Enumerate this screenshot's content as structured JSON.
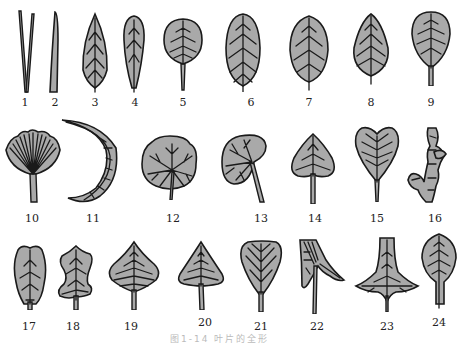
{
  "figure": {
    "caption": "图1-14  叶片的全形",
    "fill_color": "#a9a9a9",
    "stroke_color": "#1a1a1a",
    "leaves": [
      {
        "id": 1,
        "label": "1",
        "shape": "needle-pair"
      },
      {
        "id": 2,
        "label": "2",
        "shape": "linear"
      },
      {
        "id": 3,
        "label": "3",
        "shape": "lanceolate"
      },
      {
        "id": 4,
        "label": "4",
        "shape": "oblanceolate"
      },
      {
        "id": 5,
        "label": "5",
        "shape": "orbicular"
      },
      {
        "id": 6,
        "label": "6",
        "shape": "oblong"
      },
      {
        "id": 7,
        "label": "7",
        "shape": "elliptic"
      },
      {
        "id": 8,
        "label": "8",
        "shape": "ovate"
      },
      {
        "id": 9,
        "label": "9",
        "shape": "obovate"
      },
      {
        "id": 10,
        "label": "10",
        "shape": "flabellate"
      },
      {
        "id": 11,
        "label": "11",
        "shape": "falcate"
      },
      {
        "id": 12,
        "label": "12",
        "shape": "peltate"
      },
      {
        "id": 13,
        "label": "13",
        "shape": "reniform"
      },
      {
        "id": 14,
        "label": "14",
        "shape": "cordate"
      },
      {
        "id": 15,
        "label": "15",
        "shape": "obcordate"
      },
      {
        "id": 16,
        "label": "16",
        "shape": "scale-like"
      },
      {
        "id": 17,
        "label": "17",
        "shape": "spatulate"
      },
      {
        "id": 18,
        "label": "18",
        "shape": "lyrate"
      },
      {
        "id": 19,
        "label": "19",
        "shape": "rhomboid"
      },
      {
        "id": 20,
        "label": "20",
        "shape": "deltoid"
      },
      {
        "id": 21,
        "label": "21",
        "shape": "cuneate"
      },
      {
        "id": 22,
        "label": "22",
        "shape": "sagittate"
      },
      {
        "id": 23,
        "label": "23",
        "shape": "hastate"
      },
      {
        "id": 24,
        "label": "24",
        "shape": "ovate-petiolate"
      }
    ]
  }
}
